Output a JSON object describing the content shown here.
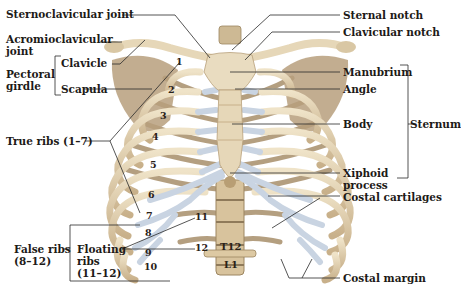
{
  "figure": {
    "colors": {
      "bone": "#e6d7b8",
      "bone_shadow": "#b9a27c",
      "bone_dark": "#8f7a5a",
      "cartilage": "#c9d4e2",
      "cartilage_highlight": "#e8eef6",
      "leader_line": "#2a2a2a",
      "label_text": "#1d1a17"
    }
  },
  "labels": {
    "sternoclavicular_joint": "Sternoclavicular joint",
    "acromioclavicular_joint_1": "Acromioclavicular",
    "acromioclavicular_joint_2": "joint",
    "pectoral_girdle_1": "Pectoral",
    "pectoral_girdle_2": "girdle",
    "clavicle": "Clavicle",
    "scapula": "Scapula",
    "true_ribs": "True ribs (1–7)",
    "false_ribs_1": "False ribs",
    "false_ribs_2": "(8–12)",
    "floating_ribs_1": "Floating",
    "floating_ribs_2": "ribs",
    "floating_ribs_3": "(11–12)",
    "sternal_notch": "Sternal notch",
    "clavicular_notch": "Clavicular notch",
    "manubrium": "Manubrium",
    "angle": "Angle",
    "body": "Body",
    "sternum": "Sternum",
    "xiphoid_process_1": "Xiphoid",
    "xiphoid_process_2": "process",
    "costal_cartilages": "Costal cartilages",
    "costal_margin": "Costal margin"
  },
  "rib_numbers": [
    "1",
    "2",
    "3",
    "4",
    "5",
    "6",
    "7",
    "8",
    "9",
    "10",
    "11",
    "12"
  ],
  "vertebrae": [
    "T12",
    "L1"
  ]
}
